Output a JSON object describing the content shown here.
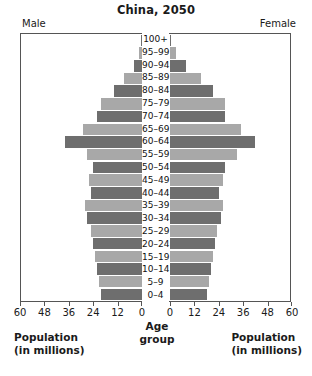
{
  "chart_data": {
    "type": "bar",
    "subtype": "population-pyramid",
    "title": "China, 2050",
    "xlabel": "Population (in millions)",
    "ylabel": "Age group",
    "xlim": [
      0,
      60
    ],
    "xticks": [
      0,
      12,
      24,
      36,
      48,
      60
    ],
    "left_xticks": [
      60,
      48,
      36,
      24,
      12,
      0
    ],
    "grid": false,
    "legend": [
      "Male",
      "Female"
    ],
    "legend_position": "top-left and top-right",
    "categories": [
      "100+",
      "95–99",
      "90–94",
      "85–89",
      "80–84",
      "75–79",
      "70–74",
      "65–69",
      "60–64",
      "55–59",
      "50–54",
      "45–49",
      "40–44",
      "35–39",
      "30–34",
      "25–29",
      "20–24",
      "15–19",
      "10–14",
      "5–9",
      "0–4"
    ],
    "series": [
      {
        "name": "Male",
        "side": "left",
        "color": "#6e6e6e",
        "alt_color": "#a8a8a8",
        "values": [
          0.3,
          1.5,
          4,
          9,
          14,
          20,
          22,
          29,
          38,
          27,
          24,
          26,
          25,
          28,
          27,
          25,
          24,
          23,
          22,
          21,
          20
        ]
      },
      {
        "name": "Female",
        "side": "right",
        "color": "#6e6e6e",
        "alt_color": "#a8a8a8",
        "values": [
          0.5,
          3,
          8,
          15,
          21,
          27,
          27,
          35,
          42,
          33,
          27,
          26,
          24,
          26,
          25,
          23,
          22,
          21,
          20,
          19,
          18
        ]
      }
    ]
  },
  "header": {
    "title": "China, 2050",
    "male_label": "Male",
    "female_label": "Female"
  },
  "footer": {
    "left_line1": "Population",
    "left_line2": "(in millions)",
    "center_line1": "Age",
    "center_line2": "group",
    "right_line1": "Population",
    "right_line2": "(in millions)"
  },
  "colors": {
    "bar_dark": "#6e6e6e",
    "bar_light": "#a8a8a8",
    "axis": "#555555",
    "text": "#1a1a1a",
    "background": "#ffffff"
  }
}
